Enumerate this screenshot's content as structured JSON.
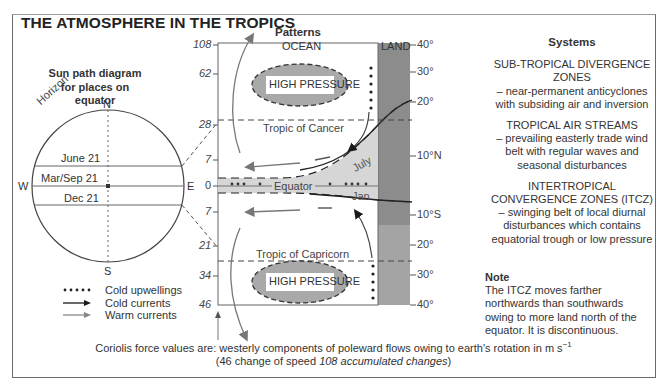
{
  "title": "THE ATMOSPHERE IN THE TROPICS",
  "sun_path": {
    "title_line1": "Sun path diagram",
    "title_line2": "for places on equator",
    "compass": {
      "n": "N",
      "s": "S",
      "e": "E",
      "w": "W"
    },
    "horizon_label": "Horizon",
    "paths": [
      {
        "label": "June 21"
      },
      {
        "label": "Mar/Sep 21"
      },
      {
        "label": "Dec 21"
      }
    ]
  },
  "patterns": {
    "heading": "Patterns",
    "ocean_label": "OCEAN",
    "land_label": "LAND",
    "high_pressure_north": "HIGH PRESSURE",
    "high_pressure_south": "HIGH PRESSURE",
    "tropic_cancer": "Tropic of Cancer",
    "tropic_capricorn": "Tropic of Capricorn",
    "equator": "Equator",
    "july": "July",
    "jan": "Jan",
    "coriolis_ticks": [
      "108",
      "62",
      "28",
      "7",
      "0",
      "7",
      "21",
      "34",
      "46"
    ],
    "latitude_ticks": [
      "40°",
      "30°",
      "20°",
      "10°N",
      "10°S",
      "20°",
      "30°",
      "40°"
    ]
  },
  "legend": {
    "items": [
      {
        "label": "Cold upwellings",
        "symbol": "dots"
      },
      {
        "label": "Cold currents",
        "symbol": "black-arrow"
      },
      {
        "label": "Warm currents",
        "symbol": "grey-arrow"
      }
    ]
  },
  "systems": {
    "heading": "Systems",
    "blocks": [
      {
        "title": "SUB-TROPICAL DIVERGENCE ZONES",
        "desc": "– near-permanent anticyclones with subsiding air and inversion"
      },
      {
        "title": "TROPICAL AIR STREAMS",
        "desc": "– prevailing easterly trade wind belt with regular waves and seasonal disturbances"
      },
      {
        "title": "INTERTROPICAL CONVERGENCE ZONES (ITCZ)",
        "desc": "– swinging belt of local diurnal disturbances which contains equatorial trough or low pressure"
      }
    ],
    "note_heading": "Note",
    "note_text": "The ITCZ moves farther northwards than southwards owing to more land north of the equator. It is discontinuous."
  },
  "footer": {
    "line1_prefix": "Coriolis force values are: westerly components of poleward flows owing to earth's rotation in m s",
    "line1_sup": "−1",
    "line2_prefix": "(46 change of speed ",
    "line2_italic": "108 accumulated changes",
    "line2_suffix": ")"
  },
  "colors": {
    "high_pressure_fill": "#a9a9a9",
    "itcz_fill": "#d6d6d6",
    "land_fill": "#8c8c8c",
    "land_lower_fill": "#a4a4a4",
    "warm_current": "#777777",
    "cold_current": "#1a1a1a"
  }
}
